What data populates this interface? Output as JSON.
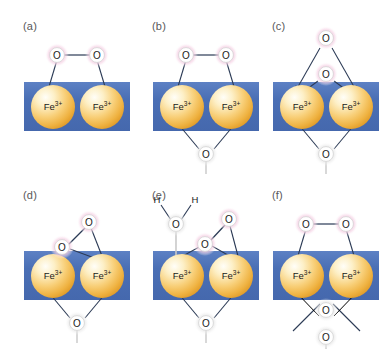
{
  "figure": {
    "background_color": "#ffffff",
    "panel_label_color": "#58585a",
    "slab_color": "#4a6fb5",
    "slab_color_light": "#5b7fc2",
    "fe_sphere_color": "#f0b040",
    "fe_sphere_highlight": "#fffdf2",
    "oxygen_halo_pink": "#f2c6dd",
    "oxygen_halo_grey": "#dcdcdc",
    "oxygen_fill": "#ffffff",
    "bond_color": "#2b3a55",
    "bold_bond_color": "#000000",
    "columns": 3,
    "rows": 2
  },
  "labels": {
    "fe": "Fe",
    "fe_charge": "3+",
    "oxygen": "O",
    "hydrogen": "H"
  },
  "panels": [
    {
      "id": "panel-a",
      "label": "(a)",
      "x": 10,
      "y": 8,
      "description": "mu-1,2-peroxo bridge across two surface Fe3+ centers",
      "atoms": {
        "fe_left": {
          "label": "Fe",
          "charge": "3+"
        },
        "fe_right": {
          "label": "Fe",
          "charge": "3+"
        },
        "o_top_left": {
          "label": "O",
          "halo": "pink"
        },
        "o_top_right": {
          "label": "O",
          "halo": "pink"
        }
      },
      "bonds": [
        "o_top_left-o_top_right",
        "o_top_left-fe_left",
        "o_top_right-fe_right"
      ]
    },
    {
      "id": "panel-b",
      "label": "(b)",
      "x": 139,
      "y": 8,
      "description": "mu-1,2-peroxo bridge plus mu-oxo bridge below the slab",
      "atoms": {
        "fe_left": {
          "label": "Fe",
          "charge": "3+"
        },
        "fe_right": {
          "label": "Fe",
          "charge": "3+"
        },
        "o_top_left": {
          "label": "O",
          "halo": "pink"
        },
        "o_top_right": {
          "label": "O",
          "halo": "pink"
        },
        "o_bottom": {
          "label": "O",
          "halo": "grey"
        }
      },
      "bonds": [
        "o_top_left-o_top_right",
        "o_top_left-fe_left",
        "o_top_right-fe_right",
        "fe_left-o_bottom",
        "fe_right-o_bottom"
      ]
    },
    {
      "id": "panel-c",
      "label": "(c)",
      "x": 259,
      "y": 8,
      "description": "terminal oxo above a mu-oxo bridge with dative arrow bonds to both Fe3+",
      "atoms": {
        "fe_left": {
          "label": "Fe",
          "charge": "3+"
        },
        "fe_right": {
          "label": "Fe",
          "charge": "3+"
        },
        "o_apex": {
          "label": "O",
          "halo": "pink"
        },
        "o_mid": {
          "label": "O",
          "halo": "pink"
        },
        "o_bottom": {
          "label": "O",
          "halo": "grey"
        }
      },
      "bonds": [
        "o_apex-fe_left",
        "o_apex-fe_right",
        "o_mid-fe_left",
        "o_mid-fe_right",
        "fe_left-o_bottom",
        "fe_right-o_bottom"
      ]
    },
    {
      "id": "panel-d",
      "label": "(d)",
      "x": 10,
      "y": 177,
      "description": "side-on eta2 peroxo on the right Fe3+ with mu-oxo bridge below",
      "atoms": {
        "fe_left": {
          "label": "Fe",
          "charge": "3+"
        },
        "fe_right": {
          "label": "Fe",
          "charge": "3+"
        },
        "o_upper": {
          "label": "O",
          "halo": "pink"
        },
        "o_lower": {
          "label": "O",
          "halo": "pink"
        },
        "o_bottom": {
          "label": "O",
          "halo": "grey"
        }
      },
      "bonds": [
        "o_upper-o_lower",
        "o_upper-fe_right",
        "o_lower-fe_right",
        "fe_left-o_bottom",
        "fe_right-o_bottom"
      ]
    },
    {
      "id": "panel-e",
      "label": "(e)",
      "x": 139,
      "y": 177,
      "description": "side-on eta2 peroxo on right Fe3+ with aqua ligand on left Fe3+ and mu-oxo bridge",
      "atoms": {
        "fe_left": {
          "label": "Fe",
          "charge": "3+"
        },
        "fe_right": {
          "label": "Fe",
          "charge": "3+"
        },
        "o_upper": {
          "label": "O",
          "halo": "pink"
        },
        "o_lower": {
          "label": "O",
          "halo": "pink"
        },
        "o_water": {
          "label": "O",
          "halo": "grey"
        },
        "h_left": {
          "label": "H"
        },
        "h_right": {
          "label": "H"
        },
        "o_bottom": {
          "label": "O",
          "halo": "grey"
        }
      },
      "bonds": [
        "o_upper-o_lower",
        "o_upper-fe_right",
        "o_lower-fe_right",
        "h_left-o_water",
        "h_right-o_water",
        "o_water-fe_left",
        "fe_left-o_bottom",
        "fe_right-o_bottom"
      ]
    },
    {
      "id": "panel-f",
      "label": "(f)",
      "x": 259,
      "y": 177,
      "description": "mu-1,2-peroxo bridge with two mu-oxo bridges below, bold dative bonds to both Fe3+",
      "atoms": {
        "fe_left": {
          "label": "Fe",
          "charge": "3+"
        },
        "fe_right": {
          "label": "Fe",
          "charge": "3+"
        },
        "o_top_left": {
          "label": "O",
          "halo": "pink"
        },
        "o_top_right": {
          "label": "O",
          "halo": "pink"
        },
        "o_mid_bottom": {
          "label": "O",
          "halo": "grey"
        },
        "o_low_bottom": {
          "label": "O",
          "halo": "grey"
        }
      },
      "bonds": [
        "o_top_left-o_top_right",
        "o_top_left-fe_left",
        "o_top_right-fe_right",
        "o_mid_bottom-fe_left",
        "o_mid_bottom-fe_right",
        "o_low_bottom-fe_left",
        "o_low_bottom-fe_right"
      ]
    }
  ]
}
